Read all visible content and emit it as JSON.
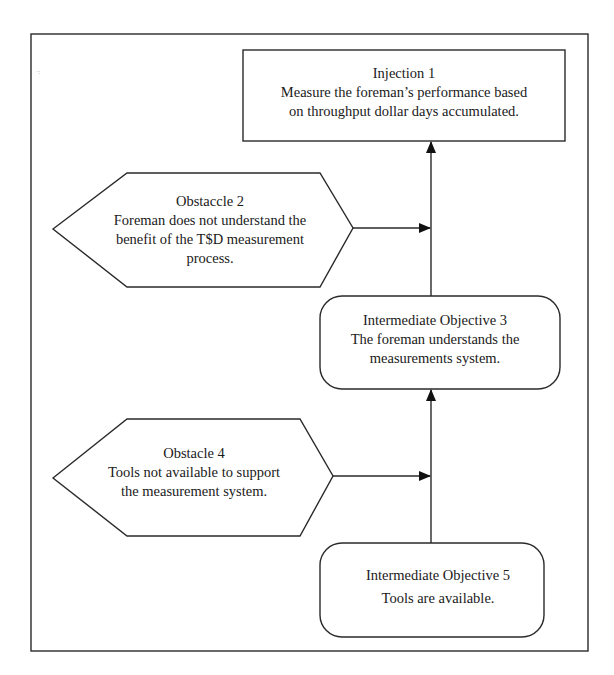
{
  "diagram": {
    "type": "prerequisite-tree",
    "colors": {
      "stroke": "#2a2a2a",
      "background": "#ffffff",
      "arrow": "#111111"
    },
    "nodes": {
      "injection_1": {
        "shape": "rectangle",
        "title": "Injection 1",
        "lines": [
          "Measure the foreman’s performance based",
          "on throughput dollar days accumulated."
        ]
      },
      "obstacle_2": {
        "shape": "hexagon",
        "title": "Obstaccle 2",
        "lines": [
          "Foreman does not understand the",
          "benefit of the T$D measurement",
          "process."
        ]
      },
      "objective_3": {
        "shape": "rounded-rectangle",
        "title": "Intermediate Objective 3",
        "lines": [
          "The foreman understands the",
          "measurements system."
        ]
      },
      "obstacle_4": {
        "shape": "hexagon",
        "title": "Obstacle 4",
        "lines": [
          "Tools not available to support",
          "the measurement system."
        ]
      },
      "objective_5": {
        "shape": "rounded-rectangle",
        "title": "Intermediate Objective 5",
        "lines": [
          "Tools are available."
        ]
      }
    },
    "edges": [
      {
        "from": "objective_5",
        "to": "objective_3"
      },
      {
        "from": "obstacle_4",
        "to": "objective_5-objective_3 link"
      },
      {
        "from": "objective_3",
        "to": "injection_1"
      },
      {
        "from": "obstacle_2",
        "to": "objective_3-injection_1 link"
      }
    ]
  }
}
